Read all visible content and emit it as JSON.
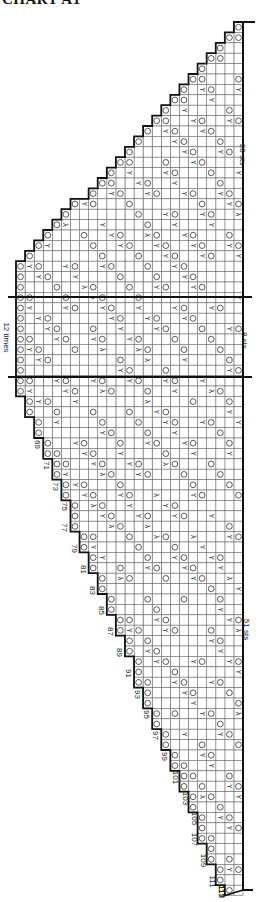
{
  "title": "CHART A1",
  "annotations": {
    "top_stitches": "28 sts",
    "repeat_stitches": "8 sts",
    "repeat_count": "12 times",
    "bottom_stitches": "51 sts"
  },
  "row_labels": [
    "69",
    "71",
    "73",
    "75",
    "77",
    "79",
    "81",
    "83",
    "85",
    "87",
    "89",
    "91",
    "93",
    "95",
    "97",
    "99",
    "101",
    "103",
    "105",
    "107",
    "109",
    "111",
    "113",
    "115",
    "117"
  ],
  "legend_symbols": {
    "yo": "O",
    "decrease": "⋎",
    "double_decrease": "⋏"
  },
  "colors": {
    "grid": "#6a6a6a",
    "border": "#111111",
    "symbol": "#333333"
  },
  "grid": {
    "cols": 25,
    "cell_w": 9.08,
    "cell_h": 10.4,
    "right_x": 243,
    "top_y": 22,
    "repeat_top_y": 297,
    "repeat_bottom_y": 377,
    "bottom_y": 890
  }
}
